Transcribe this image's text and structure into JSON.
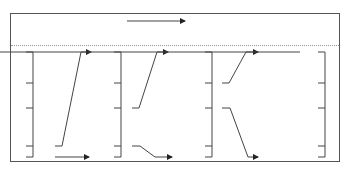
{
  "headers": [
    {
      "c": "c",
      "ci": "1",
      "eq": "=",
      "b": "b",
      "bi": "1"
    },
    {
      "c": "c",
      "ci": "2",
      "eq": "=",
      "b": "b",
      "bi": "1"
    },
    {
      "c": "c",
      "ci": "3",
      "eq": "=",
      "b": "b",
      "bi": "1"
    },
    {
      "c": "c",
      "ci": "4",
      "eq": "=",
      "b": "b",
      "bi": "1"
    }
  ],
  "axes": [
    {
      "top": "1",
      "bottom": "0",
      "segments": [
        "b4",
        "b3",
        "b2",
        "b1"
      ]
    },
    {
      "top": "0.1",
      "bottom": "0",
      "segments": [
        "b4",
        "b3",
        "b2",
        "b1"
      ]
    },
    {
      "top": "0.048",
      "bottom": "0.01",
      "segments": [
        "b4",
        "b3",
        "b2",
        "b1"
      ]
    },
    {
      "top": "0.0366",
      "mid": "0.0341",
      "bottom": "0.0282",
      "segments": [
        "b4",
        "b3",
        "b2",
        "b1"
      ]
    }
  ],
  "segment_labels": {
    "b": "b",
    "i4": "4",
    "i3": "3",
    "i2": "2",
    "i1": "1"
  }
}
